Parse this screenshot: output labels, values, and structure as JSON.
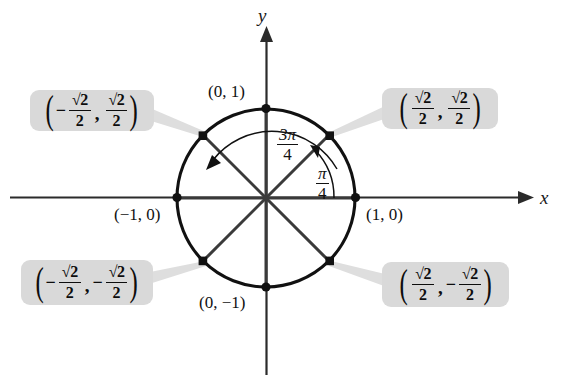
{
  "figure": {
    "type": "unit-circle-diagram",
    "background": "#ffffff",
    "stroke_color": "#111111",
    "callout_fill": "#d9d9d9",
    "connector_color": "#dcdcdc"
  },
  "axes": {
    "x_label": "x",
    "y_label": "y"
  },
  "circle": {
    "center": [
      266,
      198
    ],
    "radius": 89
  },
  "point_labels": {
    "top": "(0, 1)",
    "left": "(−1, 0)",
    "right": "(1, 0)",
    "bottom": "(0, −1)"
  },
  "angle_labels": [
    {
      "name": "three-pi-over-four",
      "numerator": "3π",
      "denominator": "4"
    },
    {
      "name": "pi-over-four",
      "numerator": "π",
      "denominator": "4"
    }
  ],
  "callouts": [
    {
      "name": "callout-top-left",
      "quadrant": "II",
      "open_paren": "(",
      "close_paren": ")",
      "comma": ",",
      "x_sign": "−",
      "x_numerator": "√2",
      "x_denominator": "2",
      "y_sign": "",
      "y_numerator": "√2",
      "y_denominator": "2",
      "text": "(−√2/2, √2/2)"
    },
    {
      "name": "callout-top-right",
      "quadrant": "I",
      "open_paren": "(",
      "close_paren": ")",
      "comma": ",",
      "x_sign": "",
      "x_numerator": "√2",
      "x_denominator": "2",
      "y_sign": "",
      "y_numerator": "√2",
      "y_denominator": "2",
      "text": "(√2/2, √2/2)"
    },
    {
      "name": "callout-bottom-left",
      "quadrant": "III",
      "open_paren": "(",
      "close_paren": ")",
      "comma": ",",
      "x_sign": "−",
      "x_numerator": "√2",
      "x_denominator": "2",
      "y_sign": "−",
      "y_numerator": "√2",
      "y_denominator": "2",
      "text": "(−√2/2, −√2/2)"
    },
    {
      "name": "callout-bottom-right",
      "quadrant": "IV",
      "open_paren": "(",
      "close_paren": ")",
      "comma": ",",
      "x_sign": "",
      "x_numerator": "√2",
      "x_denominator": "2",
      "y_sign": "−",
      "y_numerator": "√2",
      "y_denominator": "2",
      "text": "(√2/2, −√2/2)"
    }
  ]
}
